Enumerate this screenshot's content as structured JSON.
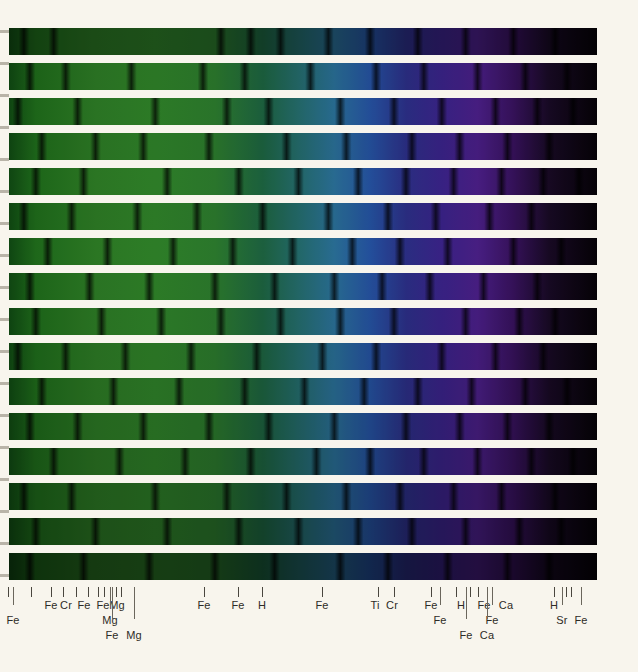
{
  "figure": {
    "kind": "stellar-spectrum-strip-chart",
    "background_color": "#f8f5ed",
    "spectrum": {
      "left_px": 0,
      "top_px": 28,
      "width_px": 597,
      "height_px": 559,
      "strip_count": 16,
      "strip_height_px": 27,
      "strip_gap_px": 8,
      "color_stops": [
        {
          "pos": "0%",
          "hex": "#0b3d10"
        },
        {
          "pos": "6%",
          "hex": "#1f6b1b"
        },
        {
          "pos": "16%",
          "hex": "#2d7a25"
        },
        {
          "pos": "26%",
          "hex": "#2f8129"
        },
        {
          "pos": "36%",
          "hex": "#2c7a2d"
        },
        {
          "pos": "44%",
          "hex": "#1d6340"
        },
        {
          "pos": "50%",
          "hex": "#246b6b"
        },
        {
          "pos": "56%",
          "hex": "#2a6f96"
        },
        {
          "pos": "62%",
          "hex": "#2552a0"
        },
        {
          "pos": "68%",
          "hex": "#2c2f86"
        },
        {
          "pos": "74%",
          "hex": "#3a2388"
        },
        {
          "pos": "80%",
          "hex": "#4a1f86"
        },
        {
          "pos": "86%",
          "hex": "#37125c"
        },
        {
          "pos": "92%",
          "hex": "#180a24"
        },
        {
          "pos": "100%",
          "hex": "#060307"
        }
      ]
    }
  },
  "left_margin_ticks_y": [
    30,
    62,
    94,
    126,
    158,
    190,
    222,
    254,
    286,
    318,
    350,
    382,
    414,
    446,
    478,
    510,
    542,
    574
  ],
  "axis": {
    "ticks_x": [
      8,
      13,
      31,
      51,
      63,
      76,
      88,
      98,
      104,
      112,
      116,
      121,
      204,
      238,
      262,
      322,
      378,
      394,
      431,
      440,
      456,
      470,
      478,
      492,
      554,
      566,
      571
    ],
    "labels": [
      {
        "text": "Fe",
        "x": 13,
        "row": 1
      },
      {
        "text": "Fe",
        "x": 51,
        "row": 0
      },
      {
        "text": "Cr",
        "x": 66,
        "row": 0
      },
      {
        "text": "Fe",
        "x": 84,
        "row": 0
      },
      {
        "text": "Fe",
        "x": 103,
        "row": 0
      },
      {
        "text": "Mg",
        "x": 117,
        "row": 0
      },
      {
        "text": "Mg",
        "x": 110,
        "row": 1
      },
      {
        "text": "Fe",
        "x": 112,
        "row": 2
      },
      {
        "text": "Mg",
        "x": 134,
        "row": 2
      },
      {
        "text": "Fe",
        "x": 204,
        "row": 0
      },
      {
        "text": "Fe",
        "x": 238,
        "row": 0
      },
      {
        "text": "H",
        "x": 262,
        "row": 0
      },
      {
        "text": "Fe",
        "x": 322,
        "row": 0
      },
      {
        "text": "Ti",
        "x": 375,
        "row": 0
      },
      {
        "text": "Cr",
        "x": 392,
        "row": 0
      },
      {
        "text": "Fe",
        "x": 431,
        "row": 0
      },
      {
        "text": "Fe",
        "x": 440,
        "row": 1
      },
      {
        "text": "H",
        "x": 461,
        "row": 0
      },
      {
        "text": "Fe",
        "x": 484,
        "row": 0
      },
      {
        "text": "Ca",
        "x": 506,
        "row": 0
      },
      {
        "text": "Fe",
        "x": 492,
        "row": 1
      },
      {
        "text": "Fe",
        "x": 466,
        "row": 2
      },
      {
        "text": "Ca",
        "x": 487,
        "row": 2
      },
      {
        "text": "H",
        "x": 554,
        "row": 0
      },
      {
        "text": "Sr",
        "x": 562,
        "row": 1
      },
      {
        "text": "Fe",
        "x": 581,
        "row": 1
      }
    ]
  },
  "chart_data": {
    "type": "heatmap",
    "title": "",
    "xlabel": "",
    "ylabel": "",
    "note": "Each of the 16 stacked strips is one contiguous wavelength segment of the same stellar spectrum; colour maps wavelength (green at left through blue/violet to black at right) and darkness maps absorption depth.",
    "series": [
      {
        "name": "strip-1",
        "brightness": 0.62,
        "dark_lines_x_pct": [
          4,
          9,
          37,
          42,
          47,
          55,
          62,
          70,
          78,
          86,
          93
        ]
      },
      {
        "name": "strip-2",
        "brightness": 0.92,
        "dark_lines_x_pct": [
          5,
          11,
          22,
          34,
          41,
          52,
          63,
          71,
          80,
          88,
          95
        ]
      },
      {
        "name": "strip-3",
        "brightness": 0.95,
        "dark_lines_x_pct": [
          3,
          13,
          26,
          38,
          45,
          57,
          66,
          74,
          83,
          90,
          96
        ]
      },
      {
        "name": "strip-4",
        "brightness": 0.93,
        "dark_lines_x_pct": [
          7,
          16,
          24,
          35,
          48,
          58,
          69,
          77,
          85,
          92
        ]
      },
      {
        "name": "strip-5",
        "brightness": 0.96,
        "dark_lines_x_pct": [
          6,
          14,
          28,
          40,
          50,
          60,
          68,
          76,
          84,
          91,
          97
        ]
      },
      {
        "name": "strip-6",
        "brightness": 0.94,
        "dark_lines_x_pct": [
          4,
          12,
          23,
          33,
          44,
          55,
          65,
          73,
          82,
          89
        ]
      },
      {
        "name": "strip-7",
        "brightness": 0.97,
        "dark_lines_x_pct": [
          8,
          18,
          29,
          39,
          49,
          59,
          67,
          75,
          86,
          94
        ]
      },
      {
        "name": "strip-8",
        "brightness": 0.95,
        "dark_lines_x_pct": [
          5,
          15,
          25,
          36,
          46,
          56,
          64,
          72,
          81,
          90
        ]
      },
      {
        "name": "strip-9",
        "brightness": 0.93,
        "dark_lines_x_pct": [
          6,
          17,
          27,
          37,
          47,
          57,
          66,
          78,
          87,
          93
        ]
      },
      {
        "name": "strip-10",
        "brightness": 0.9,
        "dark_lines_x_pct": [
          3,
          11,
          21,
          32,
          43,
          54,
          63,
          74,
          83,
          91
        ]
      },
      {
        "name": "strip-11",
        "brightness": 0.88,
        "dark_lines_x_pct": [
          7,
          19,
          30,
          41,
          51,
          61,
          70,
          79,
          88,
          95
        ]
      },
      {
        "name": "strip-12",
        "brightness": 0.84,
        "dark_lines_x_pct": [
          5,
          13,
          24,
          35,
          45,
          56,
          68,
          77,
          85,
          92
        ]
      },
      {
        "name": "strip-13",
        "brightness": 0.8,
        "dark_lines_x_pct": [
          9,
          20,
          31,
          42,
          53,
          62,
          71,
          80,
          89,
          96
        ]
      },
      {
        "name": "strip-14",
        "brightness": 0.74,
        "dark_lines_x_pct": [
          4,
          12,
          26,
          38,
          48,
          58,
          67,
          76,
          84,
          93
        ]
      },
      {
        "name": "strip-15",
        "brightness": 0.66,
        "dark_lines_x_pct": [
          6,
          16,
          28,
          40,
          50,
          60,
          69,
          78,
          87,
          94
        ]
      },
      {
        "name": "strip-16",
        "brightness": 0.48,
        "dark_lines_x_pct": [
          5,
          14,
          25,
          36,
          46,
          57,
          65,
          75,
          85,
          92
        ]
      }
    ],
    "elements_identified": [
      "Fe",
      "Cr",
      "Mg",
      "H",
      "Ti",
      "Ca",
      "Sr"
    ]
  }
}
